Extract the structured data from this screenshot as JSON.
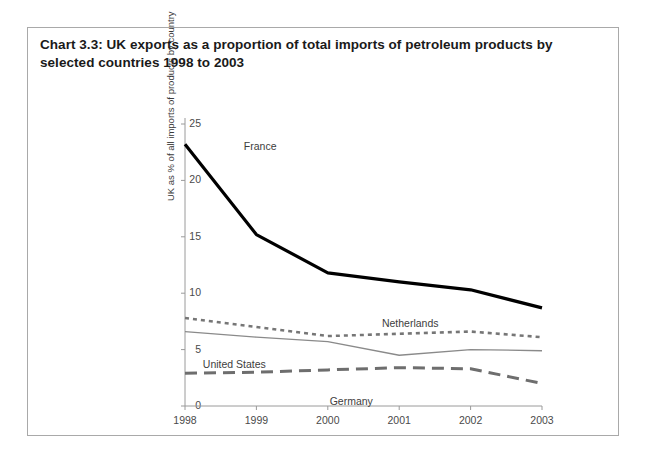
{
  "figure": {
    "title": "Chart 3.3:  UK exports as a proportion of total imports of petroleum products by selected countries 1998 to 2003"
  },
  "chart_data": {
    "type": "line",
    "title": "Chart 3.3:  UK exports as a proportion of total imports of petroleum products by selected countries 1998 to 2003",
    "xlabel": "",
    "ylabel": "UK as % of all imports of products by country",
    "categories": [
      "1998",
      "1999",
      "2000",
      "2001",
      "2002",
      "2003"
    ],
    "x_tick_labels": [
      "1998",
      "1999",
      "2000",
      "2001",
      "2002",
      "2003"
    ],
    "y_tick_labels": [
      "0",
      "5",
      "10",
      "15",
      "20",
      "25"
    ],
    "y_ticks": [
      0,
      5,
      10,
      15,
      20,
      25
    ],
    "ylim": [
      0,
      25
    ],
    "grid": false,
    "legend_position": "inline-annotations",
    "series": [
      {
        "name": "France",
        "values": [
          23.2,
          15.2,
          11.8,
          11.0,
          10.3,
          8.7
        ],
        "color": "#000000",
        "style": "solid-thick",
        "label_x_pct": 19,
        "label_y_pct": 13
      },
      {
        "name": "Netherlands",
        "values": [
          7.8,
          7.0,
          6.2,
          6.4,
          6.6,
          6.1
        ],
        "color": "#767676",
        "style": "dotted",
        "label_x_pct": 56,
        "label_y_pct": 65
      },
      {
        "name": "United States",
        "values": [
          6.6,
          6.1,
          5.7,
          4.5,
          5.0,
          4.9
        ],
        "color": "#8a8a8a",
        "style": "solid-thin",
        "label_x_pct": 8,
        "label_y_pct": 77
      },
      {
        "name": "Germany",
        "values": [
          2.9,
          3.0,
          3.2,
          3.4,
          3.3,
          2.0
        ],
        "color": "#6e6e6e",
        "style": "dashed",
        "label_x_pct": 42,
        "label_y_pct": 88
      }
    ]
  },
  "colors": {
    "frame_border": "#a9a9a9",
    "axis": "#9a9a9a",
    "text": "#3a3a3a",
    "background": "#ffffff"
  }
}
